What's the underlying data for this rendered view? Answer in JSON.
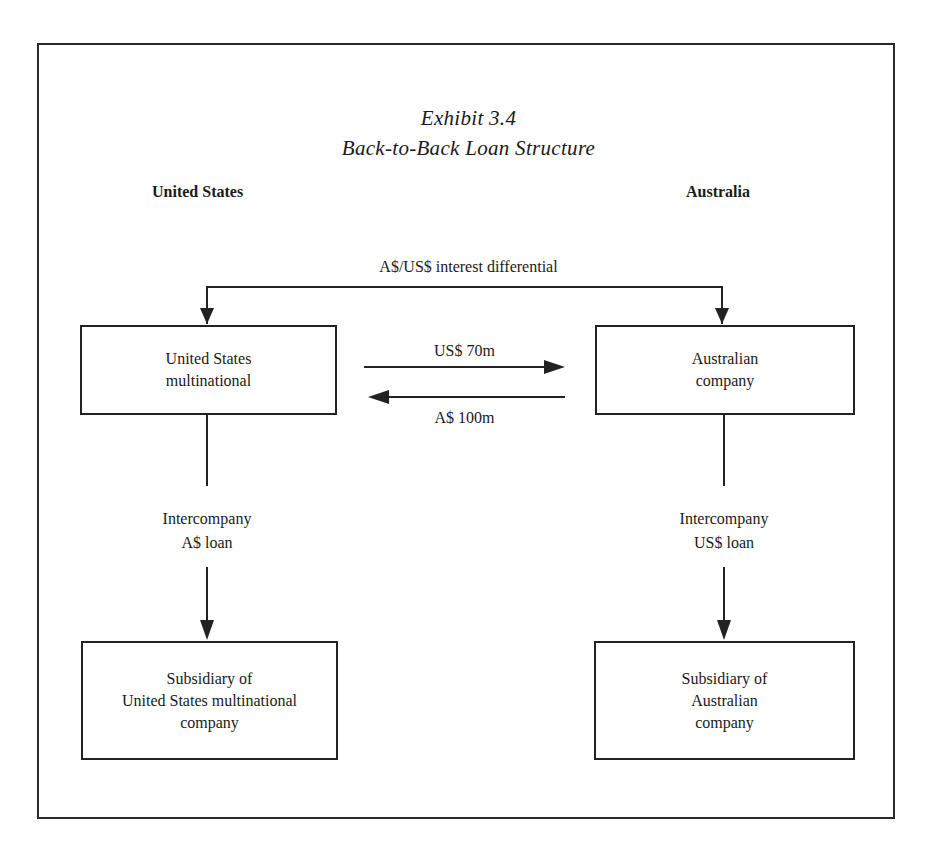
{
  "exhibit": {
    "number": "Exhibit 3.4",
    "title": "Back-to-Back Loan Structure"
  },
  "regions": {
    "left": "United States",
    "right": "Australia"
  },
  "top_link": {
    "label": "A$/US$ interest differential"
  },
  "boxes": {
    "us_parent": {
      "line1": "United States",
      "line2": "multinational"
    },
    "au_parent": {
      "line1": "Australian",
      "line2": "company"
    },
    "us_sub": {
      "line1": "Subsidiary of",
      "line2": "United States multinational",
      "line3": "company"
    },
    "au_sub": {
      "line1": "Subsidiary of",
      "line2": "Australian",
      "line3": "company"
    }
  },
  "flows": {
    "to_australia": "US$ 70m",
    "to_us": "A$ 100m"
  },
  "intercompany": {
    "left": {
      "line1": "Intercompany",
      "line2": "A$ loan"
    },
    "right": {
      "line1": "Intercompany",
      "line2": "US$ loan"
    }
  },
  "colors": {
    "line": "#222222",
    "background": "#ffffff"
  }
}
